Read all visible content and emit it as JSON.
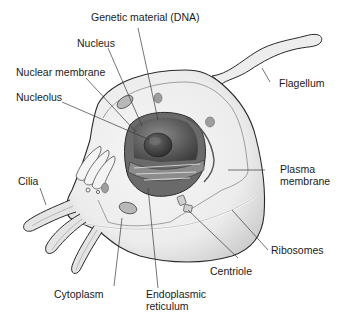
{
  "diagram": {
    "colors": {
      "background": "#ffffff",
      "cell_fill": "#eeeeee",
      "outline": "#2a2a2a",
      "nucleus_dark": "#5a5a5a",
      "nucleolus": "#3a3a3a",
      "leader_line": "#3a3a3a",
      "text": "#1a1a1a"
    },
    "labels": {
      "genetic_material": "Genetic material (DNA)",
      "nucleus": "Nucleus",
      "nuclear_membrane": "Nuclear membrane",
      "nucleolus": "Nucleolus",
      "flagellum": "Flagellum",
      "cilia": "Cilia",
      "plasma_membrane_1": "Plasma",
      "plasma_membrane_2": "membrane",
      "ribosomes": "Ribosomes",
      "centriole": "Centriole",
      "cytoplasm": "Cytoplasm",
      "endoplasmic_reticulum_1": "Endoplasmic",
      "endoplasmic_reticulum_2": "reticulum"
    }
  }
}
